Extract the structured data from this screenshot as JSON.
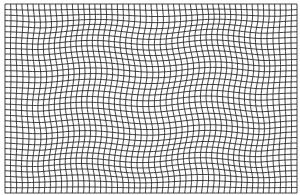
{
  "figure": {
    "type": "deformed-grid",
    "background": "#ffffff",
    "line_color": "#2a2a2a",
    "line_width": 0.9,
    "bounds": {
      "x0": 5,
      "y0": 4,
      "x1": 297,
      "y1": 193
    },
    "columns": 52,
    "rows": 34,
    "warp": {
      "x_amplitude": 1.6,
      "y_amplitude": 1.8,
      "x_frequency": 3.2,
      "y_frequency": 2.4,
      "center_boost": 1.4
    }
  }
}
